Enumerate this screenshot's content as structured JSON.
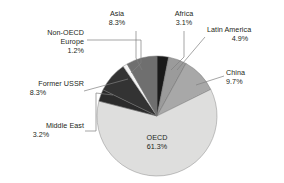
{
  "chart_data": {
    "type": "pie",
    "title": "",
    "subtitle": "",
    "xlabel": "",
    "ylabel": "",
    "grid": false,
    "legend": "none",
    "labels_inside": [
      "OECD"
    ],
    "start_angle_deg": 0,
    "direction": "clockwise",
    "categories": [
      "Africa",
      "Latin America",
      "China",
      "OECD",
      "Middle East",
      "Former USSR",
      "Non-OECD Europe",
      "Asia"
    ],
    "values": [
      3.1,
      4.9,
      9.7,
      61.3,
      3.2,
      8.3,
      1.2,
      8.3
    ],
    "value_suffix": "%",
    "slices": [
      {
        "name": "Africa",
        "value": 3.1,
        "value_text": "3.1%",
        "color": "#1a1a1a",
        "stroke": "#6e6e6e"
      },
      {
        "name": "Latin America",
        "value": 4.9,
        "value_text": "4.9%",
        "color": "#9b9b9b",
        "stroke": "#6e6e6e"
      },
      {
        "name": "China",
        "value": 9.7,
        "value_text": "9.7%",
        "color": "#a8a8a8",
        "stroke": "#6e6e6e"
      },
      {
        "name": "OECD",
        "value": 61.3,
        "value_text": "61.3%",
        "color": "#dededd",
        "stroke": "#8a8a8a"
      },
      {
        "name": "Middle East",
        "value": 3.2,
        "value_text": "3.2%",
        "color": "#2b2b2b",
        "stroke": "#6e6e6e"
      },
      {
        "name": "Former USSR",
        "value": 8.3,
        "value_text": "8.3%",
        "color": "#333333",
        "stroke": "#6e6e6e"
      },
      {
        "name": "Non-OECD Europe",
        "value": 1.2,
        "value_text": "1.2%",
        "color": "#f4f4f4",
        "stroke": "#8a8a8a"
      },
      {
        "name": "Asia",
        "value": 8.3,
        "value_text": "8.3%",
        "color": "#6f6f6f",
        "stroke": "#6e6e6e"
      }
    ],
    "total": 100.0
  },
  "labels": {
    "asia": {
      "name": "Asia",
      "value": "8.3%"
    },
    "africa": {
      "name": "Africa",
      "value": "3.1%"
    },
    "latin": {
      "name": "Latin America",
      "value": "4.9%"
    },
    "china": {
      "name": "China",
      "value": "9.7%"
    },
    "nonoecd": {
      "name": "Non-OECD",
      "name2": "Europe",
      "value": "1.2%"
    },
    "ussr": {
      "name": "Former USSR",
      "value": "8.3%"
    },
    "mideast": {
      "name": "Middle East",
      "value": "3.2%"
    },
    "oecd": {
      "name": "OECD",
      "value": "61.3%"
    }
  },
  "style": {
    "background": "#ffffff",
    "text_color": "#231f20",
    "leader_line_color": "#808080"
  }
}
